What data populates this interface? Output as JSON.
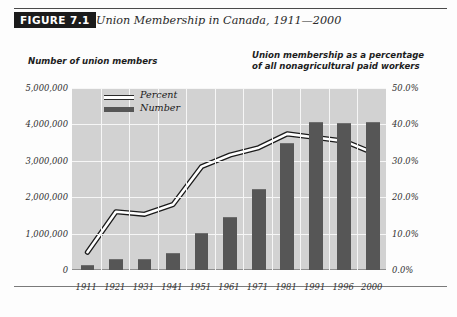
{
  "header": {
    "figure_tag": "FIGURE 7.1",
    "title": "Union Membership in Canada, 1911—2000"
  },
  "captions": {
    "left": "Number of union members",
    "right_line1": "Union membership as a percentage",
    "right_line2": "of all nonagricultural paid workers"
  },
  "legend": {
    "percent": "Percent",
    "number": "Number"
  },
  "axes": {
    "left_ticks": [
      "5,000,000",
      "4,000,000",
      "3,000,000",
      "2,000,000",
      "1,000,000",
      "0"
    ],
    "right_ticks": [
      "50.0%",
      "40.0%",
      "30.0%",
      "20.0%",
      "10.0%",
      "0.0%"
    ]
  },
  "colors": {
    "bar": "#565656",
    "plot_background": "#d2d2d2",
    "gridline": "#f6f6f6",
    "line": "#ffffff",
    "line_outline": "#1b1b1b",
    "tag_background": "#1b1b1b"
  },
  "chart_data": {
    "type": "bar",
    "title": "Union Membership in Canada, 1911—2000",
    "xlabel": "",
    "ylabel": "Number of union members",
    "y2label": "Union membership as a percentage of all nonagricultural paid workers",
    "categories": [
      "1911",
      "1921",
      "1931",
      "1941",
      "1951",
      "1961",
      "1971",
      "1981",
      "1991",
      "1996",
      "2000"
    ],
    "ylim": [
      0,
      5000000
    ],
    "y2lim": [
      0,
      50
    ],
    "yticks": [
      0,
      1000000,
      2000000,
      3000000,
      4000000,
      5000000
    ],
    "y2ticks": [
      0,
      10,
      20,
      30,
      40,
      50
    ],
    "grid": true,
    "legend_position": "top-left-inside",
    "series": [
      {
        "name": "Number",
        "type": "bar",
        "axis": "left",
        "values": [
          130000,
          310000,
          310000,
          460000,
          1030000,
          1450000,
          2230000,
          3490000,
          4070000,
          4030000,
          4060000
        ]
      },
      {
        "name": "Percent",
        "type": "line",
        "axis": "right",
        "values": [
          4.9,
          16.0,
          15.3,
          18.0,
          28.4,
          31.6,
          33.6,
          37.4,
          36.4,
          35.4,
          32.2
        ]
      }
    ]
  }
}
